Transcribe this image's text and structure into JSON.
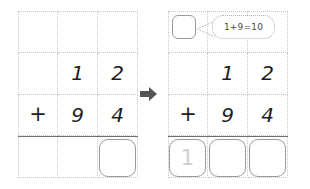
{
  "diagram": {
    "arrow_icon": "right-arrow-icon",
    "colors": {
      "grid_line": "#c9c9c9",
      "rule_line": "#6f6f6f",
      "box_border": "#9a9a9a",
      "digit": "#1d1d1d",
      "ghost_digit": "#cfcfcf",
      "arrow": "#555555",
      "bubble_border": "#b0b0b0",
      "bubble_text": "#4a4a4a"
    },
    "panels": [
      {
        "id": "before",
        "label": "before-state",
        "rows": [
          {
            "label": "carry-row",
            "cells": [
              "",
              "",
              ""
            ]
          },
          {
            "label": "addend-row-1",
            "cells": [
              "",
              "1",
              "2"
            ]
          },
          {
            "label": "addend-row-2",
            "cells": [
              "+",
              "9",
              "4"
            ]
          },
          {
            "label": "answer-row",
            "cells": [
              "",
              "",
              ""
            ]
          }
        ],
        "answer_boxes": [
          {
            "column": 2,
            "value": ""
          }
        ],
        "carry_box": null,
        "bubble": null
      },
      {
        "id": "after",
        "label": "after-state",
        "rows": [
          {
            "label": "carry-row",
            "cells": [
              "",
              "",
              ""
            ]
          },
          {
            "label": "addend-row-1",
            "cells": [
              "",
              "1",
              "2"
            ]
          },
          {
            "label": "addend-row-2",
            "cells": [
              "+",
              "9",
              "4"
            ]
          },
          {
            "label": "answer-row",
            "cells": [
              "",
              "",
              ""
            ]
          }
        ],
        "answer_boxes": [
          {
            "column": 0,
            "value": "1"
          },
          {
            "column": 1,
            "value": ""
          },
          {
            "column": 2,
            "value": ""
          }
        ],
        "carry_box": {
          "column": 0,
          "value": ""
        },
        "bubble": {
          "text": "1+9=10"
        }
      }
    ]
  }
}
